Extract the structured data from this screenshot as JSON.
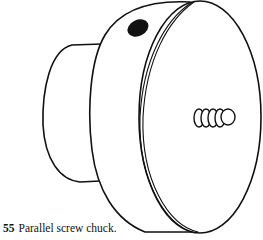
{
  "figure": {
    "stroke_color": "#111111",
    "fill_color": "#ffffff"
  },
  "caption": {
    "number": "55",
    "text": "Parallel screw chuck."
  }
}
